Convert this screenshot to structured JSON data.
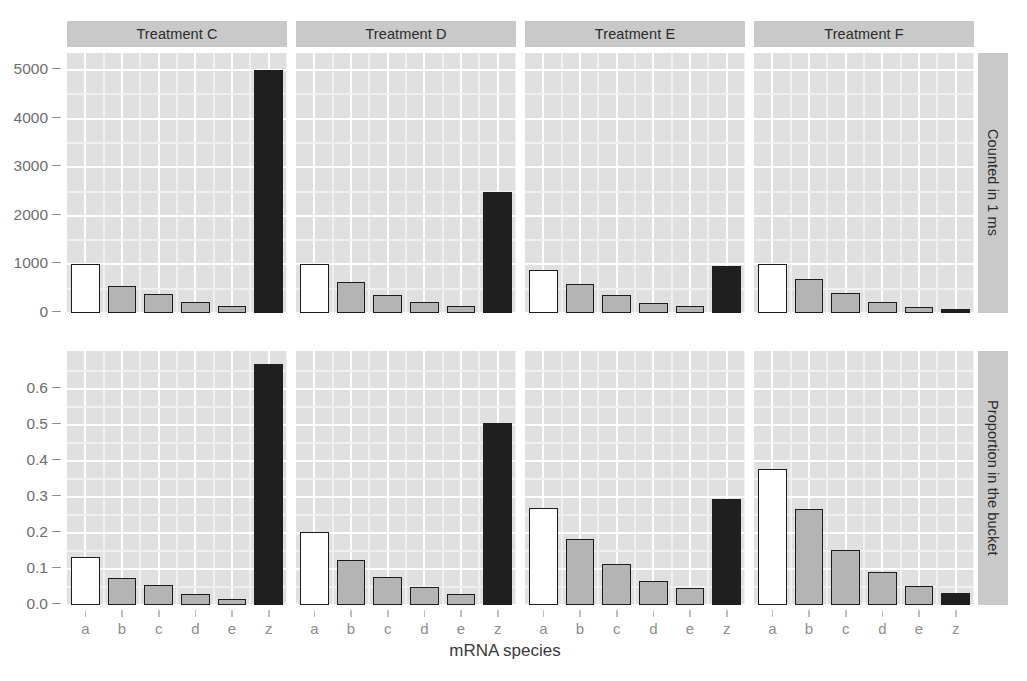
{
  "chart_data": {
    "type": "bar",
    "title": "",
    "xlabel": "mRNA species",
    "ylabel": "",
    "categories": [
      "a",
      "b",
      "c",
      "d",
      "e",
      "z"
    ],
    "facet_columns": [
      "Treatment C",
      "Treatment D",
      "Treatment E",
      "Treatment F"
    ],
    "facet_rows": [
      "Counted in 1 ms",
      "Proportion in the bucket"
    ],
    "grid": true,
    "legend": "none",
    "panels": [
      {
        "row": "Counted in 1 ms",
        "column": "Treatment C",
        "ylim": [
          0,
          5350
        ],
        "yticks": [
          0,
          1000,
          2000,
          3000,
          4000,
          5000
        ],
        "ytick_labels": [
          "0",
          "1000",
          "2000",
          "3000",
          "4000",
          "5000"
        ],
        "values": [
          1000,
          560,
          400,
          220,
          140,
          5000
        ],
        "fills": [
          "white",
          "grey",
          "grey",
          "grey",
          "grey",
          "black"
        ]
      },
      {
        "row": "Counted in 1 ms",
        "column": "Treatment D",
        "ylim": [
          0,
          5350
        ],
        "values": [
          1000,
          640,
          380,
          230,
          150,
          2500
        ],
        "fills": [
          "white",
          "grey",
          "grey",
          "grey",
          "grey",
          "black"
        ]
      },
      {
        "row": "Counted in 1 ms",
        "column": "Treatment E",
        "ylim": [
          0,
          5350
        ],
        "values": [
          880,
          600,
          380,
          210,
          150,
          960
        ],
        "fills": [
          "white",
          "grey",
          "grey",
          "grey",
          "grey",
          "black"
        ]
      },
      {
        "row": "Counted in 1 ms",
        "column": "Treatment F",
        "ylim": [
          0,
          5350
        ],
        "values": [
          1000,
          700,
          410,
          230,
          130,
          80
        ],
        "fills": [
          "white",
          "grey",
          "grey",
          "grey",
          "grey",
          "black"
        ]
      },
      {
        "row": "Proportion in the bucket",
        "column": "Treatment C",
        "ylim": [
          0,
          0.705
        ],
        "yticks": [
          0.0,
          0.1,
          0.2,
          0.3,
          0.4,
          0.5,
          0.6
        ],
        "ytick_labels": [
          "0.0",
          "0.1",
          "0.2",
          "0.3",
          "0.4",
          "0.5",
          "0.6"
        ],
        "values": [
          0.134,
          0.075,
          0.055,
          0.03,
          0.018,
          0.668
        ],
        "fills": [
          "white",
          "grey",
          "grey",
          "grey",
          "grey",
          "black"
        ]
      },
      {
        "row": "Proportion in the bucket",
        "column": "Treatment D",
        "ylim": [
          0,
          0.705
        ],
        "values": [
          0.202,
          0.126,
          0.077,
          0.05,
          0.031,
          0.504
        ],
        "fills": [
          "white",
          "grey",
          "grey",
          "grey",
          "grey",
          "black"
        ]
      },
      {
        "row": "Proportion in the bucket",
        "column": "Treatment E",
        "ylim": [
          0,
          0.705
        ],
        "values": [
          0.27,
          0.184,
          0.114,
          0.068,
          0.048,
          0.295
        ],
        "fills": [
          "white",
          "grey",
          "grey",
          "grey",
          "grey",
          "black"
        ]
      },
      {
        "row": "Proportion in the bucket",
        "column": "Treatment F",
        "ylim": [
          0,
          0.705
        ],
        "values": [
          0.377,
          0.267,
          0.154,
          0.093,
          0.053,
          0.033
        ],
        "fills": [
          "white",
          "grey",
          "grey",
          "grey",
          "grey",
          "black"
        ]
      }
    ],
    "colors": {
      "panel_background": "#e0e0e0",
      "strip_background": "#c9c9c9",
      "gridline": "#ffffff",
      "bar_white": "#ffffff",
      "bar_grey": "#b4b4b4",
      "bar_black": "#201f1f",
      "bar_outline": "#1c1c1c",
      "axis_text": "#6e6e6e",
      "axis_title": "#3a3a3a"
    }
  },
  "axes": {
    "x_title": "mRNA species",
    "x_tick_labels": [
      "a",
      "b",
      "c",
      "d",
      "e",
      "z"
    ],
    "y_top_tick_labels": [
      "5000",
      "4000",
      "3000",
      "2000",
      "1000",
      "0"
    ],
    "y_bottom_tick_labels": [
      "0.6",
      "0.5",
      "0.4",
      "0.3",
      "0.2",
      "0.1",
      "0.0"
    ],
    "tick_dash": "–"
  },
  "strips": {
    "columns": [
      "Treatment C",
      "Treatment D",
      "Treatment E",
      "Treatment F"
    ],
    "rows": [
      "Counted in 1 ms",
      "Proportion in the bucket"
    ]
  }
}
